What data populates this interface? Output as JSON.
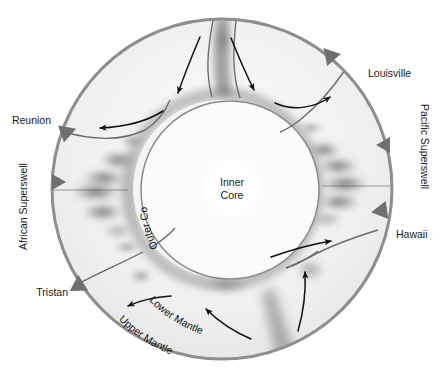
{
  "figure": {
    "type": "earth-interior-cross-section",
    "background_color": "#ffffff",
    "outer_boundary_color": "#8e8e8e",
    "mantle_fill_color": "#f2f2f2",
    "core_fill_color": "#fbfbfb",
    "inner_core_fill_color": "#ffffff",
    "anomaly_color": "#555555",
    "hotspot_marker_color": "#6f6f6f",
    "arrow_color": "#111111"
  },
  "geometry": {
    "center_x": 222,
    "center_y": 189,
    "outer_radius": 171,
    "outer_core_radius": 89,
    "inner_core_radius": 33
  },
  "core_labels": {
    "inner_core_line1": "Inner",
    "inner_core_line2": "Core",
    "outer_core": "Outer Core"
  },
  "mantle_labels": {
    "lower_mantle": "Lower Mantle",
    "upper_mantle": "Upper Mantle"
  },
  "superswells": [
    {
      "id": "african-superswell",
      "label": "African Superswell",
      "side": "left",
      "rotation": -90
    },
    {
      "id": "pacific-superswell",
      "label": "Pacific Superswell",
      "side": "right",
      "rotation": 90
    }
  ],
  "hotspots": [
    {
      "id": "louisville",
      "label": "Louisville",
      "angle_deg": 49,
      "label_x": 368,
      "label_y": 77,
      "anchor": "start"
    },
    {
      "id": "reunion",
      "label": "Reunion",
      "angle_deg": 161,
      "label_x": 48,
      "label_y": 124,
      "anchor": "end"
    },
    {
      "id": "hawaii",
      "label": "Hawaii",
      "angle_deg": 352,
      "label_x": 396,
      "label_y": 238,
      "anchor": "start"
    },
    {
      "id": "tristan",
      "label": "Tristan",
      "angle_deg": 208,
      "label_x": 66,
      "label_y": 295,
      "anchor": "end"
    },
    {
      "id": "marker-left-mid",
      "label": "",
      "angle_deg": 181,
      "label_x": 0,
      "label_y": 0,
      "anchor": "end"
    },
    {
      "id": "marker-right-upper",
      "label": "",
      "angle_deg": 14,
      "label_x": 0,
      "label_y": 0,
      "anchor": "start"
    }
  ],
  "convection_arrows": [
    {
      "id": "arrow-downwelling-top-left",
      "direction": "downward-inward"
    },
    {
      "id": "arrow-upwelling-top-right",
      "direction": "upward-outward"
    },
    {
      "id": "arrow-outflow-upper-left",
      "direction": "leftward"
    },
    {
      "id": "arrow-outflow-lower-right",
      "direction": "rightward"
    },
    {
      "id": "arrow-upwelling-bottom-right",
      "direction": "upward"
    },
    {
      "id": "arrow-inflow-bottom-center",
      "direction": "leftward"
    },
    {
      "id": "arrow-outflow-bottom-left",
      "direction": "leftward"
    },
    {
      "id": "arrow-upflow-bottom-center-right",
      "direction": "upward-left"
    }
  ]
}
